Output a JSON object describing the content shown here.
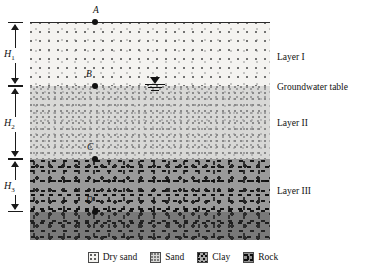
{
  "figure": {
    "background_color": "#ffffff"
  },
  "layers": [
    {
      "id": "layer-1",
      "name": "Layer I",
      "label": "Layer I",
      "material": "Dry sand",
      "thickness_label": "H",
      "thickness_subscript": "1",
      "fill_color": "#f4f3f0",
      "top_px": 22,
      "height_px": 64
    },
    {
      "id": "layer-2",
      "name": "Layer II",
      "label": "Layer II",
      "material": "Sand",
      "thickness_label": "H",
      "thickness_subscript": "2",
      "fill_color": "#d8d8d6",
      "top_px": 86,
      "height_px": 73
    },
    {
      "id": "layer-3",
      "name": "Layer III",
      "label": "Layer III",
      "material": "Rock",
      "thickness_label": "H",
      "thickness_subscript": "3",
      "fill_color": "#9a9a9a",
      "top_px": 159,
      "height_px": 81
    }
  ],
  "dimensions": [
    {
      "id": "h1",
      "label": "H",
      "subscript": "1"
    },
    {
      "id": "h2",
      "label": "H",
      "subscript": "2"
    },
    {
      "id": "h3",
      "label": "H",
      "subscript": "3"
    }
  ],
  "points": [
    {
      "id": "point-a",
      "label": "A",
      "description": "ground surface"
    },
    {
      "id": "point-b",
      "label": "B",
      "description": "top of Layer II / groundwater table"
    },
    {
      "id": "point-c",
      "label": "C",
      "description": "top of Layer III"
    },
    {
      "id": "point-d",
      "label": "D",
      "description": "within Layer III"
    }
  ],
  "annotations": {
    "groundwater_table": "Groundwater table",
    "groundwater_symbol": "water-table-triangle"
  },
  "legend": {
    "items": [
      {
        "id": "legend-dry-sand",
        "label": "Dry sand",
        "swatch": "dry-sand-swatch",
        "color": "#f4f3f0"
      },
      {
        "id": "legend-sand",
        "label": "Sand",
        "swatch": "sand-swatch",
        "color": "#d8d8d6"
      },
      {
        "id": "legend-clay",
        "label": "Clay",
        "swatch": "clay-swatch",
        "color": "#a8a8a8"
      },
      {
        "id": "legend-rock",
        "label": "Rock",
        "swatch": "rock-swatch",
        "color": "#8f8f8f"
      }
    ]
  }
}
